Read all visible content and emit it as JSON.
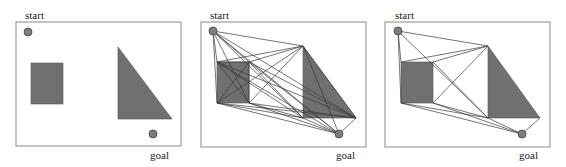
{
  "figure": {
    "colors": {
      "frame": "#8a8a8a",
      "obstacle": "#707070",
      "edge": "#3a3a3a",
      "node": "#7d7d7d"
    }
  },
  "panels": [
    {
      "id": "workspace",
      "start_label": "start",
      "goal_label": "goal",
      "frame": {
        "x": 16,
        "y": 22,
        "w": 165,
        "h": 124
      },
      "start": {
        "x": 28,
        "y": 32
      },
      "goal": {
        "x": 153,
        "y": 134
      },
      "start_label_pos": {
        "x": 25,
        "y": 19
      },
      "goal_label_pos": {
        "x": 150,
        "y": 159
      },
      "rect": {
        "x": 31,
        "y": 63,
        "w": 32,
        "h": 41
      },
      "triangle": [
        [
          118,
          47
        ],
        [
          118,
          119
        ],
        [
          172,
          119
        ]
      ],
      "edges": []
    },
    {
      "id": "visibility-graph-full",
      "start_label": "start",
      "goal_label": "goal",
      "frame": {
        "x": 201,
        "y": 22,
        "w": 165,
        "h": 125
      },
      "start": {
        "x": 213,
        "y": 31
      },
      "goal": {
        "x": 339,
        "y": 134
      },
      "start_label_pos": {
        "x": 210,
        "y": 19
      },
      "goal_label_pos": {
        "x": 336,
        "y": 159
      },
      "rect": {
        "x": 217,
        "y": 62,
        "w": 32,
        "h": 41
      },
      "triangle": [
        [
          303,
          46
        ],
        [
          303,
          118
        ],
        [
          356,
          118
        ]
      ],
      "edges": [
        [
          [
            213,
            31
          ],
          [
            303,
            46
          ]
        ],
        [
          [
            213,
            31
          ],
          [
            217,
            62
          ]
        ],
        [
          [
            213,
            31
          ],
          [
            249,
            62
          ]
        ],
        [
          [
            213,
            31
          ],
          [
            217,
            103
          ]
        ],
        [
          [
            213,
            31
          ],
          [
            249,
            103
          ]
        ],
        [
          [
            213,
            31
          ],
          [
            303,
            118
          ]
        ],
        [
          [
            213,
            31
          ],
          [
            356,
            118
          ]
        ],
        [
          [
            213,
            31
          ],
          [
            339,
            134
          ]
        ],
        [
          [
            217,
            62
          ],
          [
            303,
            46
          ]
        ],
        [
          [
            249,
            62
          ],
          [
            303,
            46
          ]
        ],
        [
          [
            217,
            103
          ],
          [
            303,
            46
          ]
        ],
        [
          [
            249,
            103
          ],
          [
            303,
            46
          ]
        ],
        [
          [
            217,
            62
          ],
          [
            303,
            118
          ]
        ],
        [
          [
            217,
            62
          ],
          [
            356,
            118
          ]
        ],
        [
          [
            249,
            62
          ],
          [
            303,
            118
          ]
        ],
        [
          [
            249,
            62
          ],
          [
            356,
            118
          ]
        ],
        [
          [
            217,
            62
          ],
          [
            339,
            134
          ]
        ],
        [
          [
            249,
            62
          ],
          [
            339,
            134
          ]
        ],
        [
          [
            217,
            62
          ],
          [
            249,
            103
          ]
        ],
        [
          [
            249,
            62
          ],
          [
            217,
            103
          ]
        ],
        [
          [
            217,
            103
          ],
          [
            303,
            118
          ]
        ],
        [
          [
            249,
            103
          ],
          [
            303,
            118
          ]
        ],
        [
          [
            217,
            103
          ],
          [
            356,
            118
          ]
        ],
        [
          [
            249,
            103
          ],
          [
            356,
            118
          ]
        ],
        [
          [
            217,
            103
          ],
          [
            339,
            134
          ]
        ],
        [
          [
            249,
            103
          ],
          [
            339,
            134
          ]
        ],
        [
          [
            303,
            46
          ],
          [
            339,
            134
          ]
        ],
        [
          [
            303,
            46
          ],
          [
            356,
            118
          ]
        ],
        [
          [
            303,
            118
          ],
          [
            339,
            134
          ]
        ],
        [
          [
            356,
            118
          ],
          [
            339,
            134
          ]
        ],
        [
          [
            217,
            62
          ],
          [
            249,
            62
          ]
        ],
        [
          [
            249,
            62
          ],
          [
            249,
            103
          ]
        ]
      ]
    },
    {
      "id": "visibility-graph-reduced",
      "start_label": "start",
      "goal_label": "goal",
      "frame": {
        "x": 385,
        "y": 22,
        "w": 165,
        "h": 125
      },
      "start": {
        "x": 398,
        "y": 31
      },
      "goal": {
        "x": 522,
        "y": 134
      },
      "start_label_pos": {
        "x": 395,
        "y": 19
      },
      "goal_label_pos": {
        "x": 519,
        "y": 159
      },
      "rect": {
        "x": 401,
        "y": 62,
        "w": 32,
        "h": 41
      },
      "triangle": [
        [
          488,
          46
        ],
        [
          488,
          118
        ],
        [
          540,
          118
        ]
      ],
      "edges": [
        [
          [
            398,
            31
          ],
          [
            488,
            46
          ]
        ],
        [
          [
            398,
            31
          ],
          [
            401,
            62
          ]
        ],
        [
          [
            398,
            31
          ],
          [
            401,
            103
          ]
        ],
        [
          [
            398,
            31
          ],
          [
            488,
            118
          ]
        ],
        [
          [
            401,
            62
          ],
          [
            488,
            46
          ]
        ],
        [
          [
            433,
            62
          ],
          [
            488,
            46
          ]
        ],
        [
          [
            433,
            103
          ],
          [
            488,
            46
          ]
        ],
        [
          [
            401,
            103
          ],
          [
            488,
            118
          ]
        ],
        [
          [
            433,
            103
          ],
          [
            488,
            118
          ]
        ],
        [
          [
            401,
            103
          ],
          [
            522,
            134
          ]
        ],
        [
          [
            433,
            103
          ],
          [
            522,
            134
          ]
        ],
        [
          [
            488,
            118
          ],
          [
            522,
            134
          ]
        ],
        [
          [
            540,
            118
          ],
          [
            522,
            134
          ]
        ],
        [
          [
            433,
            62
          ],
          [
            488,
            118
          ]
        ]
      ]
    }
  ]
}
